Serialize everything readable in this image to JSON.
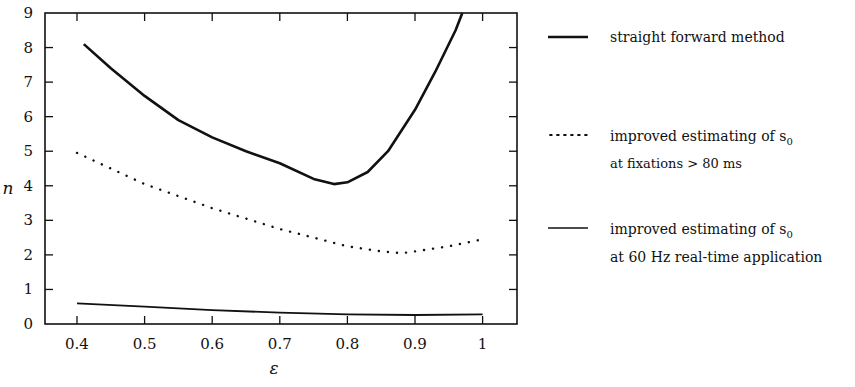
{
  "chart_data": {
    "type": "line",
    "title": "",
    "xlabel": "ε",
    "ylabel": "n",
    "xlim": [
      0.35,
      1.05
    ],
    "ylim": [
      0,
      9
    ],
    "xticks": [
      0.4,
      0.5,
      0.6,
      0.7,
      0.8,
      0.9,
      1
    ],
    "xtick_labels": [
      "0.4",
      "0.5",
      "0.6",
      "0.7",
      "0.8",
      "0.9",
      "1"
    ],
    "yticks": [
      0,
      1,
      2,
      3,
      4,
      5,
      6,
      7,
      8,
      9
    ],
    "ytick_labels": [
      "0",
      "1",
      "2",
      "3",
      "4",
      "5",
      "6",
      "7",
      "8",
      "9"
    ],
    "grid": false,
    "legend_position": "right",
    "series": [
      {
        "name": "straight forward method",
        "style": "solid-thick",
        "x": [
          0.41,
          0.45,
          0.5,
          0.55,
          0.6,
          0.65,
          0.7,
          0.75,
          0.78,
          0.8,
          0.83,
          0.86,
          0.9,
          0.93,
          0.96,
          0.97
        ],
        "y": [
          8.1,
          7.4,
          6.6,
          5.9,
          5.4,
          5.0,
          4.65,
          4.2,
          4.05,
          4.1,
          4.4,
          5.0,
          6.2,
          7.3,
          8.5,
          9.0
        ]
      },
      {
        "name": "improved estimating of s0 at fixations > 80 ms",
        "style": "dotted",
        "x": [
          0.4,
          0.45,
          0.5,
          0.55,
          0.6,
          0.65,
          0.7,
          0.75,
          0.8,
          0.85,
          0.88,
          0.9,
          0.95,
          1.0
        ],
        "y": [
          4.95,
          4.5,
          4.05,
          3.7,
          3.35,
          3.05,
          2.75,
          2.5,
          2.25,
          2.1,
          2.05,
          2.1,
          2.25,
          2.45
        ]
      },
      {
        "name": "improved estimating of s0 at 60 Hz real-time application",
        "style": "solid-thin",
        "x": [
          0.4,
          0.5,
          0.6,
          0.7,
          0.8,
          0.9,
          1.0
        ],
        "y": [
          0.6,
          0.5,
          0.4,
          0.33,
          0.28,
          0.26,
          0.28
        ]
      }
    ]
  },
  "legend": {
    "items": [
      {
        "lines": [
          "straight forward method"
        ],
        "style": "solid-thick"
      },
      {
        "lines": [
          "improved estimating of s",
          "at fixations > 80 ms"
        ],
        "subscript": "0",
        "style": "dotted"
      },
      {
        "lines": [
          "improved estimating of s",
          "at 60 Hz real-time application"
        ],
        "subscript": "0",
        "style": "solid-thin"
      }
    ]
  },
  "colors": {
    "ink": "#111111",
    "background": "#ffffff"
  }
}
